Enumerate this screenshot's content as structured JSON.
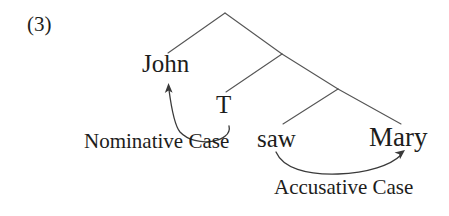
{
  "figure": {
    "example_number": "(3)",
    "background_color": "#ffffff",
    "ink_color": "#1d1d1b",
    "line_color": "#555555",
    "width": 449,
    "height": 216
  },
  "tree": {
    "terminals": [
      {
        "id": "john",
        "label": "John"
      },
      {
        "id": "t",
        "label": "T"
      },
      {
        "id": "saw",
        "label": "saw"
      },
      {
        "id": "mary",
        "label": "Mary"
      }
    ],
    "branches": [
      {
        "from": [
          225,
          13
        ],
        "to": [
          168,
          53
        ]
      },
      {
        "from": [
          225,
          13
        ],
        "to": [
          282,
          54
        ]
      },
      {
        "from": [
          282,
          54
        ],
        "to": [
          226,
          92
        ]
      },
      {
        "from": [
          282,
          54
        ],
        "to": [
          338,
          89
        ]
      },
      {
        "from": [
          338,
          89
        ],
        "to": [
          283,
          124
        ]
      },
      {
        "from": [
          338,
          89
        ],
        "to": [
          401,
          124
        ]
      }
    ]
  },
  "annotations": [
    {
      "id": "nominative",
      "label": "Nominative Case",
      "source": "T",
      "target": "John",
      "arrow_path": "M 229,126 C 233,142 196,149 180,132 C 174,125 171,105 169,90",
      "arrowhead": [
        168,
        84
      ]
    },
    {
      "id": "accusative",
      "label": "Accusative Case",
      "source": "saw",
      "target": "Mary",
      "arrow_path": "M 276,152 C 283,168 306,175 338,174 C 368,173 391,165 401,155",
      "arrowhead": [
        404,
        151
      ]
    }
  ]
}
